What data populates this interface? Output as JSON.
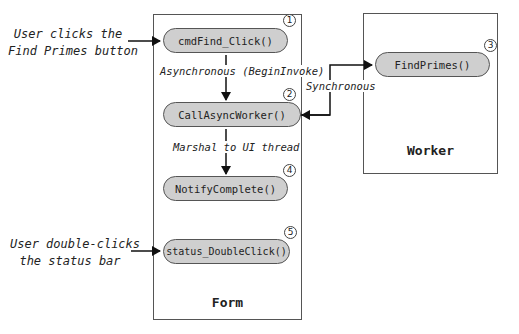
{
  "diagram": {
    "type": "flow",
    "containers": {
      "form": {
        "title": "Form"
      },
      "worker": {
        "title": "Worker"
      }
    },
    "nodes": [
      {
        "id": 1,
        "number": "1",
        "label": "cmdFind_Click()",
        "container": "form"
      },
      {
        "id": 2,
        "number": "2",
        "label": "CallAsyncWorker()",
        "container": "form"
      },
      {
        "id": 3,
        "number": "3",
        "label": "FindPrimes()",
        "container": "worker"
      },
      {
        "id": 4,
        "number": "4",
        "label": "NotifyComplete()",
        "container": "form"
      },
      {
        "id": 5,
        "number": "5",
        "label": "status_DoubleClick()",
        "container": "form"
      }
    ],
    "edges": [
      {
        "from": "external",
        "to": 1,
        "label": "User clicks the Find Primes button"
      },
      {
        "from": 1,
        "to": 2,
        "label": "Asynchronous (BeginInvoke)"
      },
      {
        "from": 2,
        "to": 3,
        "label": "Synchronous",
        "bidirectional": true
      },
      {
        "from": 2,
        "to": 4,
        "label": "Marshal to UI thread"
      },
      {
        "from": "external",
        "to": 5,
        "label": "User double-clicks the status bar"
      }
    ],
    "external_labels": {
      "find_primes": {
        "line1": "User clicks the",
        "line2": "Find Primes button"
      },
      "status_bar": {
        "line1": "User double-clicks",
        "line2": "the status bar"
      }
    },
    "edge_labels": {
      "async": "Asynchronous (BeginInvoke)",
      "sync": "Synchronous",
      "marshal": "Marshal to UI thread"
    }
  }
}
